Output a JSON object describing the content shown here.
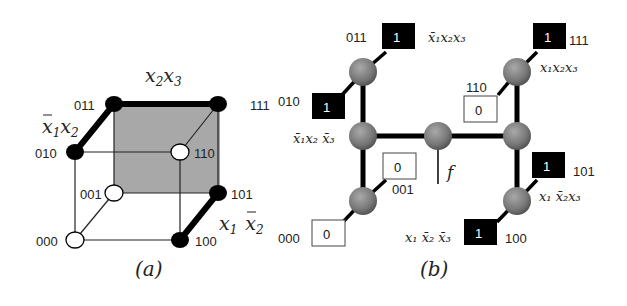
{
  "panel_a": {
    "caption": "(a)",
    "vertices": {
      "v000": "000",
      "v001": "001",
      "v010": "010",
      "v011": "011",
      "v100": "100",
      "v101": "101",
      "v110": "110",
      "v111": "111"
    },
    "term_labels": {
      "x2x3": {
        "base1": "x",
        "sub1": "2",
        "base2": "x",
        "sub2": "3"
      },
      "nx1x2": {
        "base1": "x",
        "sub1": "1",
        "base2": "x",
        "sub2": "2"
      },
      "x1nx2": {
        "base1": "x",
        "sub1": "1",
        "base2": "x",
        "sub2": "2"
      }
    },
    "colors": {
      "filled_vertex": "#000000",
      "empty_vertex": "#ffffff",
      "shaded_face": "#a8a8a8"
    }
  },
  "panel_b": {
    "caption": "(b)",
    "output_label": "f",
    "leaves": {
      "l011": {
        "code": "011",
        "value": "1"
      },
      "l010": {
        "code": "010",
        "value": "1"
      },
      "l000": {
        "code": "000",
        "value": "0"
      },
      "l001": {
        "code": "001",
        "value": "0"
      },
      "l110": {
        "code": "110",
        "value": "0"
      },
      "l111": {
        "code": "111",
        "value": "1"
      },
      "l101": {
        "code": "101",
        "value": "1"
      },
      "l100": {
        "code": "100",
        "value": "1"
      }
    },
    "minterm_labels": {
      "m011": "x̄₁x₂x₃",
      "m010": "x̄₁x₂ x̄₃",
      "m111": "x₁x₂x₃",
      "m101": "x₁ x̄₂x₃",
      "m100": "x₁ x̄₂ x̄₃"
    },
    "colors": {
      "node": "#7a7a7a",
      "one_box": "#000000",
      "zero_box": "#ffffff"
    }
  }
}
